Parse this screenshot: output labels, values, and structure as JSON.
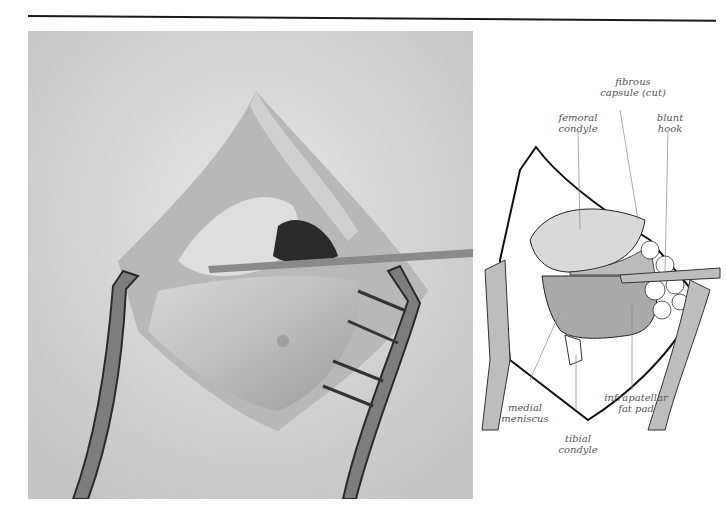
{
  "page": {
    "figure_type": "surgical photograph with labeled anatomical diagram",
    "photo": {
      "description": "grayscale intraoperative photograph of an opened knee joint with retractors and a blunt hook"
    },
    "diagram": {
      "labels": {
        "fibrous_capsule": [
          "fibrous",
          "capsule (cut)"
        ],
        "femoral_condyle": [
          "femoral",
          "condyle"
        ],
        "blunt_hook": [
          "blunt",
          "hook"
        ],
        "medial_meniscus": [
          "medial",
          "meniscus"
        ],
        "tibial_condyle": [
          "tibial",
          "condyle"
        ],
        "infrapatellar_fat_pad": [
          "infrapatellar",
          "fat pad"
        ]
      }
    },
    "colors": {
      "rule": "#1a1a1a",
      "label_text": "#555555",
      "femoral_fill": "#d9d9d9",
      "meniscus_fill": "#a9a9a9",
      "instrument_fill": "#bdbdbd"
    }
  }
}
